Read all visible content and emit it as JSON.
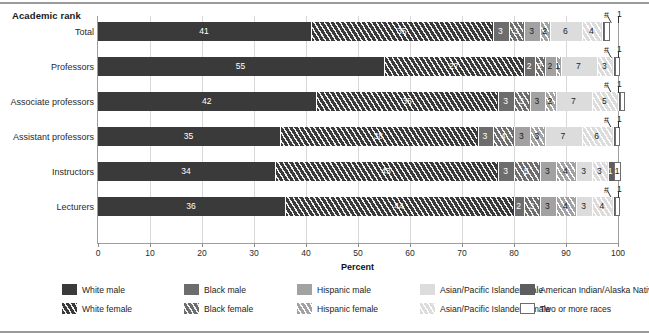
{
  "chart_data": {
    "type": "bar",
    "orientation": "horizontal",
    "stacked": true,
    "title": "",
    "axis_group_title": "Academic rank",
    "xlabel": "Percent",
    "ylabel": "",
    "xlim": [
      0,
      100
    ],
    "xticks": [
      0,
      10,
      20,
      30,
      40,
      50,
      60,
      70,
      80,
      90,
      100
    ],
    "grid": true,
    "legend_position": "bottom",
    "categories": [
      "Total",
      "Professors",
      "Associate professors",
      "Assistant professors",
      "Instructors",
      "Lecturers"
    ],
    "series": [
      {
        "name": "White male",
        "key": "wm",
        "color": "#3a3a3a",
        "hatched": false,
        "values": [
          41,
          55,
          42,
          35,
          34,
          36
        ]
      },
      {
        "name": "White female",
        "key": "wf",
        "color": "#3a3a3a",
        "hatched": true,
        "values": [
          35,
          27,
          35,
          38,
          43,
          44
        ]
      },
      {
        "name": "Black male",
        "key": "bm",
        "color": "#6d6d6d",
        "hatched": false,
        "values": [
          3,
          2,
          3,
          3,
          3,
          2
        ]
      },
      {
        "name": "Black female",
        "key": "bf",
        "color": "#6d6d6d",
        "hatched": true,
        "values": [
          3,
          2,
          3,
          4,
          5,
          3
        ]
      },
      {
        "name": "Hispanic male",
        "key": "hm",
        "color": "#a2a2a2",
        "hatched": false,
        "values": [
          3,
          2,
          3,
          3,
          3,
          3
        ]
      },
      {
        "name": "Hispanic female",
        "key": "hf",
        "color": "#a2a2a2",
        "hatched": true,
        "values": [
          2,
          1,
          2,
          3,
          4,
          4
        ]
      },
      {
        "name": "Asian/Pacific Islander male",
        "key": "am",
        "color": "#dcdcdc",
        "hatched": false,
        "values": [
          6,
          7,
          7,
          7,
          3,
          3
        ]
      },
      {
        "name": "Asian/Pacific Islander female",
        "key": "af",
        "color": "#dcdcdc",
        "hatched": true,
        "values": [
          4,
          3,
          5,
          6,
          3,
          4
        ]
      },
      {
        "name": "American Indian/Alaska Native",
        "key": "ai",
        "color": "#5e5e5e",
        "hatched": false,
        "values": [
          "#",
          "#",
          "#",
          "#",
          1,
          "#"
        ]
      },
      {
        "name": "Two or more races",
        "key": "tm",
        "color": "#ffffff",
        "hatched": false,
        "values": [
          1,
          1,
          1,
          1,
          1,
          1
        ]
      }
    ],
    "value_labels": {
      "Total": [
        "41",
        "35",
        "3",
        "3",
        "3",
        "2",
        "6",
        "4",
        "#",
        "1"
      ],
      "Professors": [
        "55",
        "27",
        "2",
        "2",
        "2",
        "1",
        "7",
        "3",
        "#",
        "1"
      ],
      "Associate professors": [
        "42",
        "35",
        "3",
        "3",
        "3",
        "2",
        "7",
        "5",
        "#",
        "1"
      ],
      "Assistant professors": [
        "35",
        "38",
        "3",
        "4",
        "3",
        "3",
        "7",
        "6",
        "#",
        "1"
      ],
      "Instructors": [
        "34",
        "43",
        "3",
        "5",
        "3",
        "4",
        "3",
        "3",
        "1",
        "1"
      ],
      "Lecturers": [
        "36",
        "44",
        "2",
        "3",
        "3",
        "4",
        "3",
        "4",
        "#",
        "1"
      ]
    },
    "note_symbol": "#"
  },
  "axis": {
    "group_title": "Academic rank",
    "x_label": "Percent",
    "ticks": [
      "0",
      "10",
      "20",
      "30",
      "40",
      "50",
      "60",
      "70",
      "80",
      "90",
      "100"
    ]
  },
  "rows": [
    {
      "label": "Total",
      "segments": [
        {
          "v": "41",
          "pct": 41
        },
        {
          "v": "35",
          "pct": 35
        },
        {
          "v": "3",
          "pct": 3
        },
        {
          "v": "3",
          "pct": 3
        },
        {
          "v": "3",
          "pct": 3
        },
        {
          "v": "2",
          "pct": 2
        },
        {
          "v": "6",
          "pct": 6
        },
        {
          "v": "4",
          "pct": 4
        },
        {
          "v": "",
          "pct": 0.4
        },
        {
          "v": "",
          "pct": 1
        }
      ],
      "annot_hash": "#",
      "annot_one": "1"
    },
    {
      "label": "Professors",
      "segments": [
        {
          "v": "55",
          "pct": 55
        },
        {
          "v": "27",
          "pct": 27
        },
        {
          "v": "2",
          "pct": 2
        },
        {
          "v": "2",
          "pct": 2
        },
        {
          "v": "2",
          "pct": 2
        },
        {
          "v": "1",
          "pct": 1
        },
        {
          "v": "7",
          "pct": 7
        },
        {
          "v": "3",
          "pct": 3
        },
        {
          "v": "",
          "pct": 0.4
        },
        {
          "v": "",
          "pct": 1
        }
      ],
      "annot_hash": "#",
      "annot_one": "1"
    },
    {
      "label": "Associate professors",
      "segments": [
        {
          "v": "42",
          "pct": 42
        },
        {
          "v": "35",
          "pct": 35
        },
        {
          "v": "3",
          "pct": 3
        },
        {
          "v": "3",
          "pct": 3
        },
        {
          "v": "3",
          "pct": 3
        },
        {
          "v": "2",
          "pct": 2
        },
        {
          "v": "7",
          "pct": 7
        },
        {
          "v": "5",
          "pct": 5
        },
        {
          "v": "",
          "pct": 0.4
        },
        {
          "v": "",
          "pct": 1
        }
      ],
      "annot_hash": "#",
      "annot_one": "1"
    },
    {
      "label": "Assistant professors",
      "segments": [
        {
          "v": "35",
          "pct": 35
        },
        {
          "v": "38",
          "pct": 38
        },
        {
          "v": "3",
          "pct": 3
        },
        {
          "v": "4",
          "pct": 4
        },
        {
          "v": "3",
          "pct": 3
        },
        {
          "v": "3",
          "pct": 3
        },
        {
          "v": "7",
          "pct": 7
        },
        {
          "v": "6",
          "pct": 6
        },
        {
          "v": "",
          "pct": 0.4
        },
        {
          "v": "",
          "pct": 1
        }
      ],
      "annot_hash": "#",
      "annot_one": "1"
    },
    {
      "label": "Instructors",
      "segments": [
        {
          "v": "34",
          "pct": 34
        },
        {
          "v": "43",
          "pct": 43
        },
        {
          "v": "3",
          "pct": 3
        },
        {
          "v": "5",
          "pct": 5
        },
        {
          "v": "3",
          "pct": 3
        },
        {
          "v": "4",
          "pct": 4
        },
        {
          "v": "3",
          "pct": 3
        },
        {
          "v": "3",
          "pct": 3
        },
        {
          "v": "1",
          "pct": 1.2
        },
        {
          "v": "1",
          "pct": 1.3
        }
      ],
      "annot_hash": "",
      "annot_one": ""
    },
    {
      "label": "Lecturers",
      "segments": [
        {
          "v": "36",
          "pct": 36
        },
        {
          "v": "44",
          "pct": 44
        },
        {
          "v": "2",
          "pct": 2
        },
        {
          "v": "3",
          "pct": 3
        },
        {
          "v": "3",
          "pct": 3
        },
        {
          "v": "4",
          "pct": 4
        },
        {
          "v": "3",
          "pct": 3
        },
        {
          "v": "4",
          "pct": 4
        },
        {
          "v": "",
          "pct": 0.4
        },
        {
          "v": "",
          "pct": 1
        }
      ],
      "annot_hash": "#",
      "annot_one": "1"
    }
  ],
  "legend": {
    "row1": [
      {
        "label": "White male",
        "key": "wm"
      },
      {
        "label": "Black male",
        "key": "bm"
      },
      {
        "label": "Hispanic male",
        "key": "hm"
      },
      {
        "label": "Asian/Pacific Islander male",
        "key": "am"
      },
      {
        "label": "American Indian/Alaska Native",
        "key": "ai"
      }
    ],
    "row2": [
      {
        "label": "White female",
        "key": "wf"
      },
      {
        "label": "Black female",
        "key": "bf"
      },
      {
        "label": "Hispanic female",
        "key": "hf"
      },
      {
        "label": "Asian/Pacific Islander female",
        "key": "af"
      },
      {
        "label": "Two or more races",
        "key": "tm"
      }
    ]
  },
  "colors": {
    "white_male": "#3a3a3a",
    "black_male": "#6d6d6d",
    "hispanic_male": "#a2a2a2",
    "asian_male": "#dcdcdc",
    "american_indian": "#5e5e5e",
    "two_or_more": "#ffffff",
    "grid": "#d8d8d8",
    "axis": "#9f9f9f"
  }
}
